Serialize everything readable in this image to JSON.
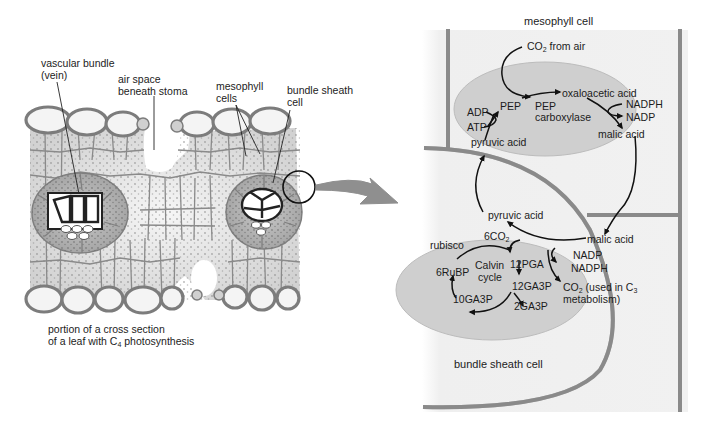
{
  "figure": {
    "colors": {
      "cell_wall": "#8a8a8a",
      "chloroplast": "#cfcfcf",
      "panel_bg": "#f0f0f0",
      "text": "#1c1c1c",
      "arrow": "#8f8f8f"
    }
  },
  "left_panel": {
    "labels": {
      "vascular_bundle_l1": "vascular bundle",
      "vascular_bundle_l2": "(vein)",
      "air_space_l1": "air space",
      "air_space_l2": "beneath stoma",
      "mesophyll_l1": "mesophyll",
      "mesophyll_l2": "cells",
      "bundle_sheath_l1": "bundle sheath",
      "bundle_sheath_l2": "cell"
    },
    "caption": {
      "line1": "portion of a cross section",
      "line2_pre": "of a leaf with C",
      "line2_sub": "4",
      "line2_post": " photosynthesis"
    }
  },
  "connector": {
    "icon": "magnify-arrow-icon"
  },
  "right_panel": {
    "mesophyll_cell_label": "mesophyll cell",
    "bundle_sheath_cell_label": "bundle sheath cell",
    "mesophyll_chloroplast": {
      "co2_pre": "CO",
      "co2_sub": "2",
      "co2_post": " from air",
      "pep": "PEP",
      "pep_carboxylase_l1": "PEP",
      "pep_carboxylase_l2": "carboxylase",
      "oxaloacetic_acid": "oxaloacetic acid",
      "nadph": "NADPH",
      "nadp": "NADP",
      "malic_acid": "malic acid",
      "adp": "ADP",
      "atp": "ATP",
      "pyruvic_acid": "pyruvic acid"
    },
    "bundle_sheath_chloroplast": {
      "pyruvic_acid": "pyruvic acid",
      "co2_6_pre": "6CO",
      "co2_6_sub": "2",
      "rubisco": "rubisco",
      "malic_acid": "malic acid",
      "nadp": "NADP",
      "nadph": "NADPH",
      "co2_used_pre": "CO",
      "co2_used_sub": "2",
      "co2_used_mid": " (used in C",
      "co2_used_sub2": "3",
      "co2_used_l2": "metabolism)",
      "pga12": "12PGA",
      "ga3p12": "12GA3P",
      "ga3p2": "2GA3P",
      "ga3p10": "10GA3P",
      "rubp6": "6RuBP",
      "calvin_l1": "Calvin",
      "calvin_l2": "cycle"
    }
  }
}
